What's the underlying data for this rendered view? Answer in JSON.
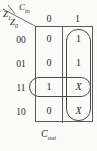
{
  "diagram": {
    "type": "karnaugh-map",
    "caption_base": "C",
    "caption_sub": "out",
    "corner": {
      "column_var_base": "C",
      "column_var_sub": "in",
      "row_var1_base": "Z",
      "row_var1_sub": "1",
      "row_var0_base": "Z",
      "row_var0_sub": "0"
    },
    "column_headers": [
      "0",
      "1"
    ],
    "row_headers": [
      "00",
      "01",
      "11",
      "10"
    ],
    "cells": [
      [
        "0",
        "1"
      ],
      [
        "0",
        "1"
      ],
      [
        "1",
        "X"
      ],
      [
        "0",
        "X"
      ]
    ],
    "groups": [
      {
        "name": "column-cin-1-group",
        "orientation": "vertical"
      },
      {
        "name": "row-11-group",
        "orientation": "horizontal"
      }
    ],
    "colors": {
      "background": "#fbfbf9",
      "line": "#5a5a5a",
      "oval": "#4a4a4a",
      "text": "#2b2b2b"
    }
  }
}
